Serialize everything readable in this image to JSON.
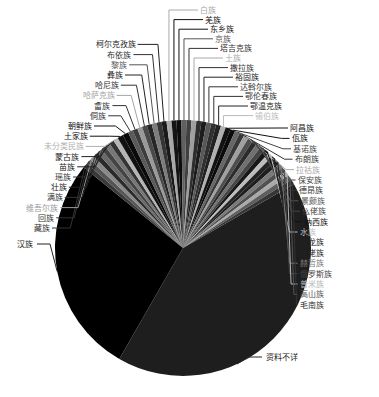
{
  "chart_data": {
    "type": "pie",
    "title": "",
    "center": [
      183,
      248
    ],
    "radius": 128,
    "start_angle_deg": 60,
    "direction": "clockwise",
    "slices": [
      {
        "label": "资料不详",
        "value": 40.0,
        "color": "#1e1e1e",
        "label_color": "#222222"
      },
      {
        "label": "汉族",
        "value": 26.5,
        "color": "#000000",
        "label_color": "#222222"
      },
      {
        "label": "藏族",
        "value": 0.6,
        "color": "#3a3a3a",
        "label_color": "#333333"
      },
      {
        "label": "回族",
        "value": 0.6,
        "color": "#555555",
        "label_color": "#333333"
      },
      {
        "label": "维吾尔族",
        "value": 0.6,
        "color": "#8a8a8a",
        "label_color": "#9a9a9a"
      },
      {
        "label": "满族",
        "value": 0.6,
        "color": "#2a2a2a",
        "label_color": "#333333"
      },
      {
        "label": "壮族",
        "value": 0.6,
        "color": "#6a6a6a",
        "label_color": "#222222"
      },
      {
        "label": "瑶族",
        "value": 0.6,
        "color": "#444444",
        "label_color": "#333333"
      },
      {
        "label": "苗族",
        "value": 0.6,
        "color": "#777777",
        "label_color": "#222222"
      },
      {
        "label": "蒙古族",
        "value": 0.6,
        "color": "#333333",
        "label_color": "#222222"
      },
      {
        "label": "未分类民族",
        "value": 0.6,
        "color": "#b5b5b5",
        "label_color": "#b0b0b0"
      },
      {
        "label": "土家族",
        "value": 0.7,
        "color": "#111111",
        "label_color": "#111111"
      },
      {
        "label": "朝鲜族",
        "value": 0.7,
        "color": "#0a0a0a",
        "label_color": "#111111"
      },
      {
        "label": "侗族",
        "value": 0.6,
        "color": "#5a5a5a",
        "label_color": "#333333"
      },
      {
        "label": "畲族",
        "value": 0.6,
        "color": "#3c3c3c",
        "label_color": "#333333"
      },
      {
        "label": "哈萨克族",
        "value": 0.6,
        "color": "#9a9a9a",
        "label_color": "#a5a5a5"
      },
      {
        "label": "哈尼族",
        "value": 0.6,
        "color": "#4a4a4a",
        "label_color": "#333333"
      },
      {
        "label": "彝族",
        "value": 0.6,
        "color": "#262626",
        "label_color": "#222222"
      },
      {
        "label": "黎族",
        "value": 0.6,
        "color": "#7d7d7d",
        "label_color": "#555555"
      },
      {
        "label": "布依族",
        "value": 0.6,
        "color": "#353535",
        "label_color": "#333333"
      },
      {
        "label": "柯尔克孜族",
        "value": 0.6,
        "color": "#1a1a1a",
        "label_color": "#222222"
      },
      {
        "label": "白族",
        "value": 0.6,
        "color": "#a8a8a8",
        "label_color": "#aaaaaa"
      },
      {
        "label": "羌族",
        "value": 0.6,
        "color": "#141414",
        "label_color": "#111111"
      },
      {
        "label": "东乡族",
        "value": 0.6,
        "color": "#0d0d0d",
        "label_color": "#111111"
      },
      {
        "label": "京族",
        "value": 0.6,
        "color": "#606060",
        "label_color": "#555555"
      },
      {
        "label": "塔吉克族",
        "value": 0.6,
        "color": "#404040",
        "label_color": "#333333"
      },
      {
        "label": "土族",
        "value": 0.6,
        "color": "#9f9f9f",
        "label_color": "#aaaaaa"
      },
      {
        "label": "撒拉族",
        "value": 0.6,
        "color": "#2e2e2e",
        "label_color": "#333333"
      },
      {
        "label": "裕固族",
        "value": 0.6,
        "color": "#1c1c1c",
        "label_color": "#222222"
      },
      {
        "label": "达斡尔族",
        "value": 0.6,
        "color": "#585858",
        "label_color": "#333333"
      },
      {
        "label": "鄂伦春族",
        "value": 0.6,
        "color": "#303030",
        "label_color": "#333333"
      },
      {
        "label": "鄂温克族",
        "value": 0.6,
        "color": "#222222",
        "label_color": "#222222"
      },
      {
        "label": "锡伯族",
        "value": 0.6,
        "color": "#b0b0b0",
        "label_color": "#bbbbbb"
      },
      {
        "label": "阿昌族",
        "value": 0.6,
        "color": "#121212",
        "label_color": "#111111"
      },
      {
        "label": "佤族",
        "value": 0.6,
        "color": "#0b0b0b",
        "label_color": "#111111"
      },
      {
        "label": "基诺族",
        "value": 0.6,
        "color": "#666666",
        "label_color": "#444444"
      },
      {
        "label": "布朗族",
        "value": 0.6,
        "color": "#383838",
        "label_color": "#333333"
      },
      {
        "label": "拉祜族",
        "value": 0.6,
        "color": "#a0a0a0",
        "label_color": "#aaaaaa"
      },
      {
        "label": "保安族",
        "value": 0.6,
        "color": "#4e4e4e",
        "label_color": "#444444"
      },
      {
        "label": "德昂族",
        "value": 0.6,
        "color": "#2c2c2c",
        "label_color": "#333333"
      },
      {
        "label": "景颇族",
        "value": 0.6,
        "color": "#707070",
        "label_color": "#555555"
      },
      {
        "label": "仫佬族",
        "value": 0.6,
        "color": "#454545",
        "label_color": "#444444"
      },
      {
        "label": "纳西族",
        "value": 0.6,
        "color": "#181818",
        "label_color": "#111111"
      },
      {
        "label": "水族",
        "value": 0.6,
        "color": "#bdbdbd",
        "label_color": "#c0c0c0"
      },
      {
        "label": "独龙族",
        "value": 0.6,
        "color": "#242424",
        "label_color": "#222222"
      },
      {
        "label": "仡佬族",
        "value": 0.6,
        "color": "#1f1f1f",
        "label_color": "#222222"
      },
      {
        "label": "赫哲族",
        "value": 0.6,
        "color": "#7a7a7a",
        "label_color": "#777777"
      },
      {
        "label": "俄罗斯族",
        "value": 0.6,
        "color": "#505050",
        "label_color": "#444444"
      },
      {
        "label": "普米族",
        "value": 0.6,
        "color": "#aaaaaa",
        "label_color": "#b5b5b5"
      },
      {
        "label": "高山族",
        "value": 0.6,
        "color": "#5e5e5e",
        "label_color": "#555555"
      },
      {
        "label": "毛南族",
        "value": 0.6,
        "color": "#363636",
        "label_color": "#333333"
      }
    ],
    "labels_layout": {
      "left": [
        "藏族",
        "回族",
        "维吾尔族",
        "满族",
        "壮族",
        "瑶族",
        "苗族",
        "蒙古族",
        "未分类民族",
        "土家族",
        "朝鲜族",
        "侗族",
        "畲族",
        "哈萨克族",
        "哈尼族",
        "彝族",
        "黎族",
        "布依族",
        "柯尔克孜族"
      ],
      "top": [
        "白族",
        "羌族",
        "东乡族",
        "京族",
        "塔吉克族",
        "土族",
        "撒拉族",
        "裕固族",
        "达斡尔族",
        "鄂伦春族",
        "鄂温克族",
        "锡伯族"
      ],
      "right": [
        "阿昌族",
        "佤族",
        "基诺族",
        "布朗族",
        "拉祜族",
        "保安族",
        "德昂族",
        "景颇族",
        "仫佬族",
        "纳西族",
        "水族",
        "独龙族",
        "仡佬族",
        "赫哲族",
        "俄罗斯族",
        "普米族",
        "高山族",
        "毛南族"
      ]
    },
    "legend": "none",
    "xlabel": "",
    "ylabel": ""
  }
}
